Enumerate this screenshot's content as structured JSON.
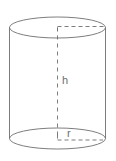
{
  "figure": {
    "type": "geometric-solid-diagram",
    "background_color": "#ffffff",
    "stroke_color": "#6e6e6e",
    "label_color": "#6e6e6e"
  },
  "labels": {
    "height": "h",
    "radius": "r"
  },
  "geometry": {
    "canvas_width": 116,
    "canvas_height": 161,
    "center_x": 57.5,
    "left_x": 9.5,
    "right_x": 106.5,
    "radius_x": 48.5,
    "top_ellipse_cy": 27.5,
    "bottom_ellipse_cy": 138.5,
    "ellipse_ry": 10.5,
    "height_line_top_y": 27.5,
    "height_line_bottom_y": 138.5
  },
  "label_positions": {
    "height_label_x": 62,
    "height_label_y": 84,
    "radius_label_x": 67,
    "radius_label_y": 136
  }
}
